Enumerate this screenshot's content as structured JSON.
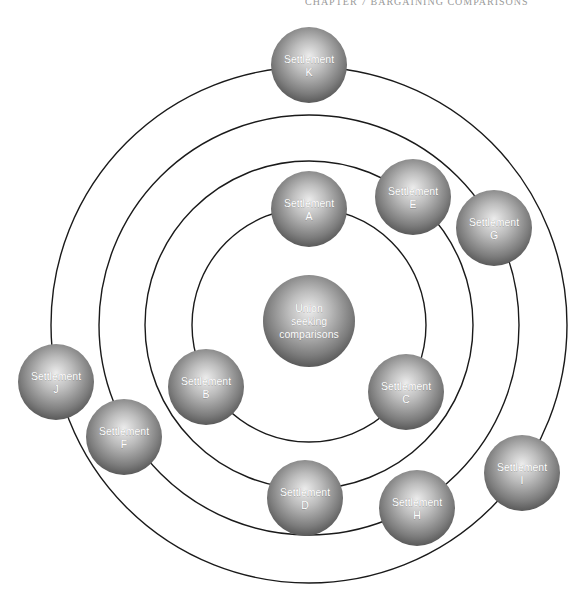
{
  "header": {
    "running_head": "CHAPTER 7 BARGAINING COMPARISONS"
  },
  "diagram": {
    "type": "concentric-orbit-diagram",
    "center": {
      "x": 309,
      "y": 325
    },
    "rings": [
      {
        "name": "ring-1",
        "radius": 117
      },
      {
        "name": "ring-2",
        "radius": 164
      },
      {
        "name": "ring-3",
        "radius": 210
      },
      {
        "name": "ring-4",
        "radius": 258
      }
    ],
    "colors": {
      "ring_stroke": "#1a1a1a",
      "sphere_highlight": "#e6e6e6",
      "sphere_mid": "#9a9a9a",
      "sphere_edge": "#555555",
      "label_text": "#ffffff"
    },
    "central_node": {
      "id": "union",
      "lines": [
        "Union",
        "seeking",
        "comparisons"
      ],
      "x": 309,
      "y": 321,
      "r": 46
    },
    "nodes": [
      {
        "id": "A",
        "line1": "Settlement",
        "line2": "A",
        "ring": 1,
        "x": 309,
        "y": 209,
        "r": 38
      },
      {
        "id": "B",
        "line1": "Settlement",
        "line2": "B",
        "ring": 1,
        "x": 206,
        "y": 387,
        "r": 38
      },
      {
        "id": "C",
        "line1": "Settlement",
        "line2": "C",
        "ring": 1,
        "x": 406,
        "y": 392,
        "r": 38
      },
      {
        "id": "D",
        "line1": "Settlement",
        "line2": "D",
        "ring": 2,
        "x": 305,
        "y": 498,
        "r": 38
      },
      {
        "id": "E",
        "line1": "Settlement",
        "line2": "E",
        "ring": 2,
        "x": 413,
        "y": 197,
        "r": 38
      },
      {
        "id": "F",
        "line1": "Settlement",
        "line2": "F",
        "ring": 3,
        "x": 124,
        "y": 437,
        "r": 38
      },
      {
        "id": "G",
        "line1": "Settlement",
        "line2": "G",
        "ring": 3,
        "x": 494,
        "y": 228,
        "r": 38
      },
      {
        "id": "H",
        "line1": "Settlement",
        "line2": "H",
        "ring": 3,
        "x": 417,
        "y": 508,
        "r": 38
      },
      {
        "id": "I",
        "line1": "Settlement",
        "line2": "I",
        "ring": 4,
        "x": 522,
        "y": 473,
        "r": 38
      },
      {
        "id": "J",
        "line1": "Settlement",
        "line2": "J",
        "ring": 4,
        "x": 56,
        "y": 382,
        "r": 38
      },
      {
        "id": "K",
        "line1": "Settlement",
        "line2": "K",
        "ring": 4,
        "x": 309,
        "y": 65,
        "r": 38
      }
    ]
  }
}
